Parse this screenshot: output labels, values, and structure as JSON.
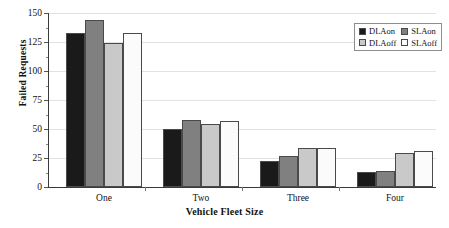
{
  "chart_data": {
    "type": "bar",
    "title": "",
    "xlabel": "Vehicle Fleet Size",
    "ylabel": "Failed Requests",
    "categories": [
      "One",
      "Two",
      "Three",
      "Four"
    ],
    "series": [
      {
        "name": "DLAon",
        "color": "#1a1a1a",
        "values": [
          133,
          50,
          22,
          13
        ]
      },
      {
        "name": "SLAon",
        "color": "#808080",
        "values": [
          144,
          58,
          27,
          14
        ]
      },
      {
        "name": "DLAoff",
        "color": "#c9c9c9",
        "values": [
          124,
          54,
          34,
          29
        ]
      },
      {
        "name": "SLAoff",
        "color": "#fbfbfb",
        "values": [
          133,
          57,
          34,
          31
        ]
      }
    ],
    "ylim": [
      0,
      150
    ],
    "yticks": [
      0,
      25,
      50,
      75,
      100,
      125,
      150
    ],
    "ytick_labels": [
      "0",
      "25",
      "50",
      "75",
      "100",
      "125",
      "150"
    ],
    "yminor_step": 12.5,
    "grid": "horizontal",
    "legend_position": "top-right",
    "legend_entries": [
      "DLAon",
      "SLAon",
      "DLAoff",
      "SLAoff"
    ]
  }
}
